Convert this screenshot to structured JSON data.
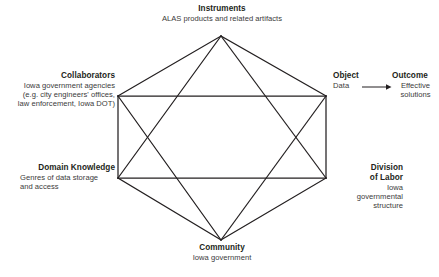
{
  "diagram": {
    "type": "activity-system-triangle",
    "nodes": [
      {
        "id": "instruments",
        "title": "Instruments",
        "description": "ALAS products and related artifacts",
        "position": "top"
      },
      {
        "id": "collaborators",
        "title": "Collaborators",
        "description": "Iowa government agencies (e.g. city engineers' offices, law enforcement, Iowa DOT)",
        "description_lines": [
          "Iowa government agencies",
          "(e.g. city engineers' offices,",
          "law enforcement, Iowa DOT)"
        ],
        "position": "upper-left"
      },
      {
        "id": "domain-knowledge",
        "title": "Domain Knowledge",
        "description": "Genres of data storage and access",
        "description_lines": [
          "Genres of data storage",
          "and access"
        ],
        "position": "lower-left"
      },
      {
        "id": "object",
        "title": "Object",
        "description": "Data",
        "position": "upper-right"
      },
      {
        "id": "outcome",
        "title": "Outcome",
        "description": "Effective solutions",
        "description_lines": [
          "Effective",
          "solutions"
        ],
        "position": "far-right"
      },
      {
        "id": "division-of-labor",
        "title": "Division of Labor",
        "title_lines": [
          "Division",
          "of Labor"
        ],
        "description": "Iowa governmental structure",
        "description_lines": [
          "Iowa",
          "governmental",
          "structure"
        ],
        "position": "lower-right"
      },
      {
        "id": "community",
        "title": "Community",
        "description": "Iowa government",
        "position": "bottom"
      }
    ],
    "colors": {
      "line": "#231f20",
      "title_text": "#231f20",
      "body_text": "#3b3b3b",
      "background": "#ffffff"
    },
    "geometry": {
      "apex_top": [
        221,
        36
      ],
      "upper_left": [
        118,
        96
      ],
      "upper_right": [
        326,
        96
      ],
      "lower_left": [
        118,
        178
      ],
      "lower_right": [
        326,
        178
      ],
      "apex_bottom": [
        221,
        240
      ]
    },
    "arrow": {
      "from": "object",
      "to": "outcome",
      "style": "single-headed"
    }
  }
}
